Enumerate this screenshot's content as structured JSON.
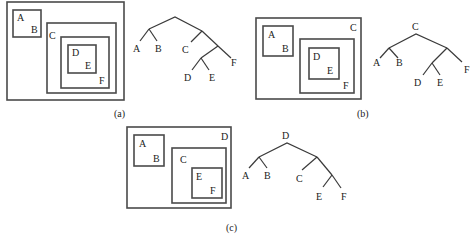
{
  "panels": [
    {
      "caption": "(a)",
      "nested_boxes": {
        "outer": {
          "label": ""
        },
        "box_ab": {
          "labels": [
            "A",
            "B"
          ]
        },
        "box_c": {
          "label": "C"
        },
        "box_f": {
          "label": "F"
        },
        "box_de": {
          "labels": [
            "D",
            "E"
          ]
        }
      },
      "tree": {
        "root_label": "",
        "leaves": [
          "A",
          "B",
          "C",
          "D",
          "E",
          "F"
        ]
      }
    },
    {
      "caption": "(b)",
      "nested_boxes": {
        "outer": {
          "label": "C"
        },
        "box_ab": {
          "labels": [
            "A",
            "B"
          ]
        },
        "box_f": {
          "label": "F"
        },
        "box_de": {
          "labels": [
            "D",
            "E"
          ]
        }
      },
      "tree": {
        "root_label": "C",
        "leaves": [
          "A",
          "B",
          "D",
          "E",
          "F"
        ]
      }
    },
    {
      "caption": "(c)",
      "nested_boxes": {
        "outer": {
          "label": "D"
        },
        "box_ab": {
          "labels": [
            "A",
            "B"
          ]
        },
        "box_c": {
          "label": "C"
        },
        "box_ef": {
          "labels": [
            "E",
            "F"
          ]
        }
      },
      "tree": {
        "root_label": "D",
        "leaves": [
          "A",
          "B",
          "C",
          "E",
          "F"
        ]
      }
    }
  ]
}
